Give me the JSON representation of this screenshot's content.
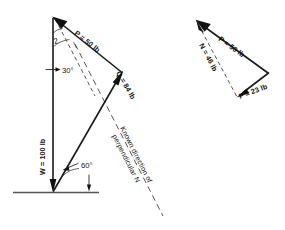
{
  "figure": {
    "units": "lb",
    "left_diagram": {
      "name": "force-polygon",
      "vectors": [
        {
          "id": "W",
          "label": "W = 100 lb",
          "symbol": "W",
          "magnitude": 100,
          "unit": "lb",
          "direction": "vertical-down"
        },
        {
          "id": "P",
          "label": "P = 50 lb",
          "symbol": "P",
          "magnitude": 50,
          "unit": "lb",
          "direction": "up-left"
        },
        {
          "id": "Q",
          "label": "Q = 84 lb",
          "symbol": "Q",
          "magnitude": 84,
          "unit": "lb",
          "direction": "up-right"
        }
      ],
      "angles": [
        {
          "id": "angle-30",
          "label": "30°",
          "value": 30
        },
        {
          "id": "angle-60",
          "label": "60°",
          "value": 60
        }
      ],
      "marks": [
        {
          "id": "tick-2",
          "label": "2"
        }
      ],
      "annotation": {
        "id": "known-direction-note",
        "line1": "Known direction of",
        "line2": "perpendicular N",
        "full": "Known direction of perpendicular N"
      }
    },
    "right_diagram": {
      "name": "force-triangle",
      "vectors": [
        {
          "id": "P2",
          "label": "P = 50 lb",
          "symbol": "P",
          "magnitude": 50,
          "unit": "lb",
          "direction": "up-left"
        },
        {
          "id": "N2",
          "label": "N = 46 lb",
          "symbol": "N",
          "magnitude": 46,
          "unit": "lb",
          "direction": "up-left"
        },
        {
          "id": "F2",
          "label": "F = 23 lb",
          "symbol": "F",
          "magnitude": 23,
          "unit": "lb",
          "direction": "left"
        }
      ]
    },
    "colors": {
      "ink": "#1a1a1a",
      "paper": "#ffffff",
      "ground": "#555555",
      "dashed": "#2a2a2a"
    }
  }
}
